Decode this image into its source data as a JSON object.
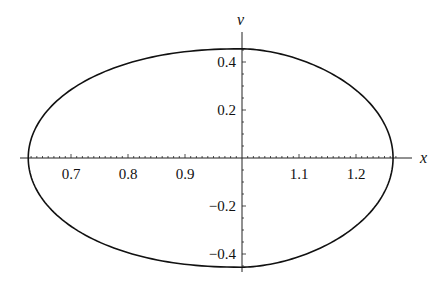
{
  "chart_data": {
    "type": "line",
    "title": "",
    "xlabel": "x",
    "ylabel": "v",
    "xlim": [
      0.62,
      1.28
    ],
    "ylim": [
      -0.46,
      0.46
    ],
    "x_ticks": [
      {
        "value": 0.7,
        "label": "0.7"
      },
      {
        "value": 0.8,
        "label": "0.8"
      },
      {
        "value": 0.9,
        "label": "0.9"
      },
      {
        "value": 1.1,
        "label": "1.1"
      },
      {
        "value": 1.2,
        "label": "1.2"
      }
    ],
    "y_ticks": [
      {
        "value": 0.4,
        "label": "0.4"
      },
      {
        "value": 0.2,
        "label": "0.2"
      },
      {
        "value": -0.2,
        "label": "−0.2"
      },
      {
        "value": -0.4,
        "label": "−0.4"
      }
    ],
    "axes_origin": {
      "x": 1.0,
      "y": 0.0
    },
    "grid": false,
    "legend": null,
    "series": [
      {
        "name": "phase orbit",
        "closed": true,
        "description": "Closed egg-shaped orbit in (x, v) plane, blunt on left, tapered on right",
        "x": [
          0.625,
          0.65,
          0.7,
          0.8,
          0.9,
          1.0,
          1.1,
          1.2,
          1.265,
          1.2,
          1.1,
          1.0,
          0.9,
          0.8,
          0.7,
          0.65,
          0.625
        ],
        "y": [
          0.0,
          0.15,
          0.26,
          0.37,
          0.43,
          0.455,
          0.43,
          0.3,
          0.0,
          -0.3,
          -0.43,
          -0.455,
          -0.43,
          -0.37,
          -0.26,
          -0.15,
          0.0
        ]
      }
    ]
  }
}
